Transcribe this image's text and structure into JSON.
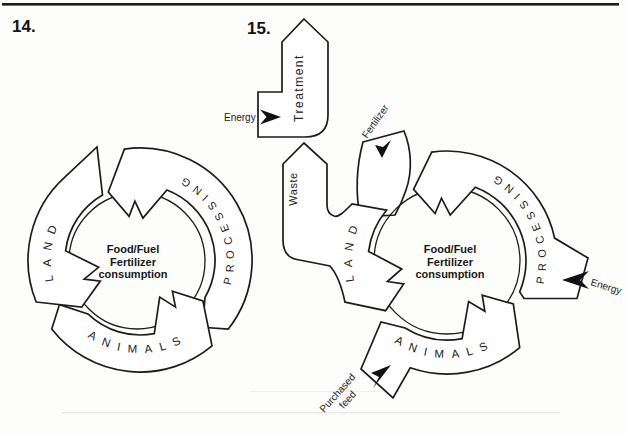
{
  "figure14": {
    "number": "14.",
    "center": {
      "line1": "Food/Fuel",
      "line2": "Fertilizer",
      "line3": "consumption"
    },
    "segments": {
      "land": "LAND",
      "processing": "PROCESSING",
      "animals": "ANIMALS"
    }
  },
  "figure15": {
    "number": "15.",
    "center": {
      "line1": "Food/Fuel",
      "line2": "Fertilizer",
      "line3": "consumption"
    },
    "segments": {
      "land": "LAND",
      "processing": "PROCESSING",
      "animals": "ANIMALS"
    },
    "flows": {
      "treatment": "Treatment",
      "waste": "Waste",
      "fertilizer": "Fertilizer",
      "energy_into_treatment": "Energy",
      "energy_into_processing": "Energy",
      "purchased_feed_line1": "Purchased",
      "purchased_feed_line2": "feed"
    }
  },
  "colors": {
    "ink": "#1c1c1c",
    "paper": "#fdfdfc",
    "arrowhead": "#111111"
  }
}
